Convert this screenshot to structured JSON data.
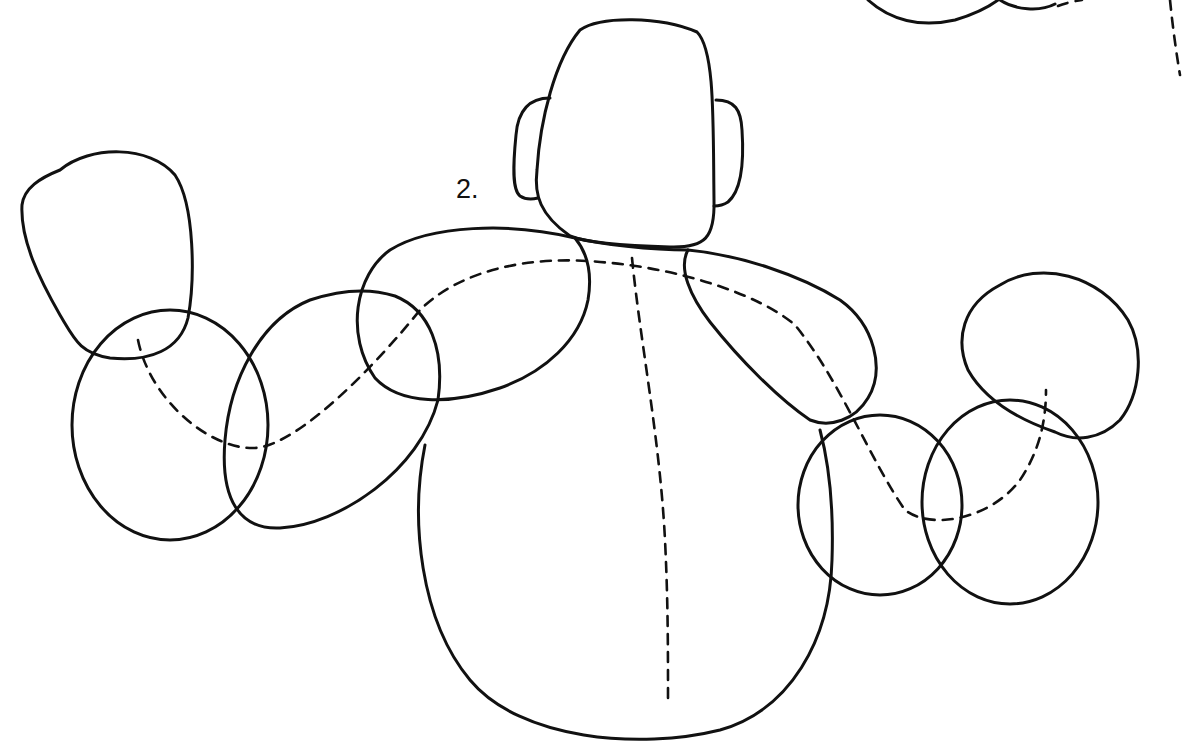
{
  "figure": {
    "label": "2.",
    "stroke_color": "#111111",
    "background_color": "#ffffff"
  }
}
